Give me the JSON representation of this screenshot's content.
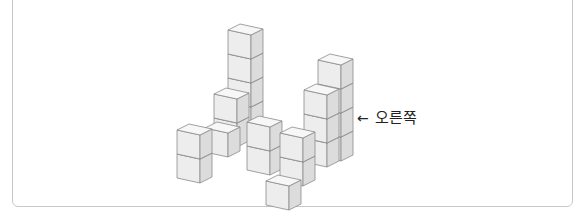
{
  "figure": {
    "direction_label": {
      "arrow": "←",
      "text": "오른쪽"
    },
    "colors": {
      "front": "#ededed",
      "side": "#dcdcdc",
      "top": "#f7f7f7",
      "edge": "#8a8a8a",
      "frame": "#c8c8c8"
    },
    "projection": {
      "front_vector": [
        23,
        5
      ],
      "depth_vector": [
        12,
        -6
      ],
      "cube_height": 24
    },
    "stacks": [
      {
        "name": "tall-tower",
        "anchor": [
          228,
          126
        ],
        "height": 4
      },
      {
        "name": "back-right-tower",
        "anchor": [
          318,
          156
        ],
        "height": 4
      },
      {
        "name": "mid-left-stack-back",
        "anchor": [
          214,
          142
        ],
        "height": 1
      },
      {
        "name": "mid-left-stack-top",
        "anchor": [
          214,
          118
        ],
        "height": 1
      },
      {
        "name": "mid-left-front-cube",
        "anchor": [
          205,
          152
        ],
        "height": 1
      },
      {
        "name": "front-right-tower",
        "anchor": [
          304,
          162
        ],
        "height": 3
      },
      {
        "name": "left-stack",
        "anchor": [
          177,
          178
        ],
        "height": 2
      },
      {
        "name": "middle-stack",
        "anchor": [
          247,
          170
        ],
        "height": 2
      },
      {
        "name": "front-back-cube",
        "anchor": [
          280,
          181
        ],
        "height": 1
      },
      {
        "name": "front-top-cube",
        "anchor": [
          280,
          157
        ],
        "height": 1
      },
      {
        "name": "front-bottom-cube",
        "anchor": [
          266,
          205
        ],
        "height": 1
      }
    ]
  }
}
